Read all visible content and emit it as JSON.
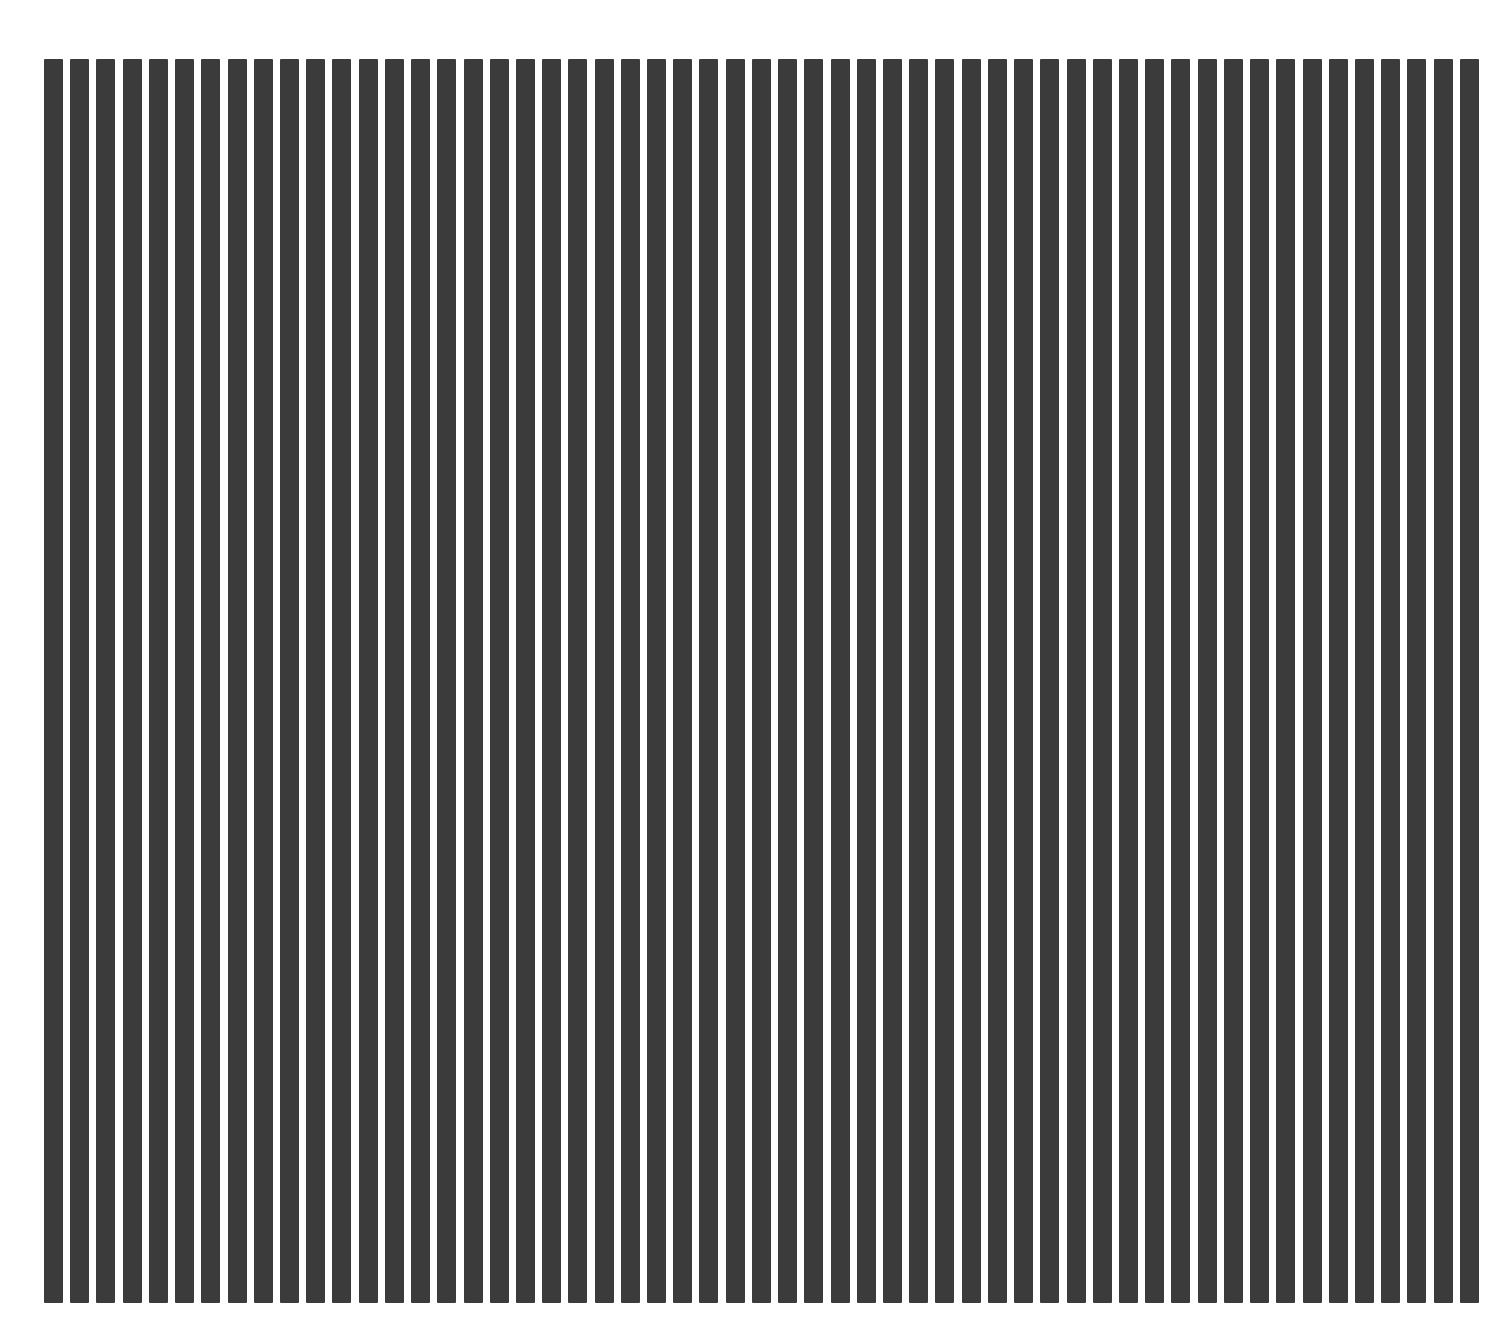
{
  "image": {
    "description": "Vertical black bar grating pattern on white background",
    "bar_count": 55,
    "bar_color": "#3b3b3b",
    "background_color": "#ffffff"
  }
}
